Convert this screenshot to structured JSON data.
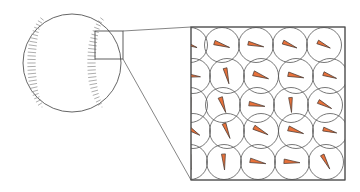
{
  "figure": {
    "background_color": "#ffffff",
    "width": 360,
    "height": 192
  },
  "colors": {
    "wedge_fill": "#E8713A",
    "wedge_stroke": "#4a3a32",
    "circle_stroke": "#555555",
    "panel_stroke": "#4d4d4d",
    "ball_stroke": "#555555",
    "seam_stroke": "#8a8a8a",
    "connector_stroke": "#666666",
    "inspect_box_stroke": "#4d4d4d"
  },
  "baseball": {
    "label": "baseball",
    "center_x": 72,
    "center_y": 63,
    "radius": 49,
    "stroke_width": 0.9,
    "seams": [
      {
        "name": "left-seam",
        "path": "M 42 19 C 28 36, 28 90, 42 107",
        "stitch_count": 26,
        "stitch_length": 7.5
      },
      {
        "name": "right-seam",
        "path": "M 102 19 C 88 36, 88 90, 102 107",
        "stitch_count": 26,
        "stitch_length": 7.5
      }
    ]
  },
  "inspection_box": {
    "label": "magnified-region",
    "x": 95,
    "y": 31,
    "width": 28,
    "height": 28,
    "stroke_width": 0.9
  },
  "connectors": [
    {
      "name": "connector-top",
      "x1": 123,
      "y1": 31,
      "x2": 191,
      "y2": 27
    },
    {
      "name": "connector-bottom",
      "x1": 123,
      "y1": 59,
      "x2": 191,
      "y2": 180
    }
  ],
  "magnified_panel": {
    "label": "magnified-view",
    "x": 191,
    "y": 27,
    "width": 154,
    "height": 153,
    "stroke_width": 0.9,
    "circle_radius": 17.5,
    "circle_stroke_width": 0.8,
    "wedge_stroke_width": 0.7,
    "wedge_length": 15.5,
    "wedge_half_angle": 8.5,
    "cells": [
      {
        "id": "c01",
        "cx": 190,
        "cy": 45,
        "angle": 200,
        "len": 15,
        "half_angle": 8
      },
      {
        "id": "c02",
        "cx": 222,
        "cy": 45,
        "angle": 198,
        "len": 16,
        "half_angle": 8
      },
      {
        "id": "c03",
        "cx": 256,
        "cy": 45,
        "angle": 193,
        "len": 16,
        "half_angle": 7
      },
      {
        "id": "c04",
        "cx": 290,
        "cy": 45,
        "angle": 203,
        "len": 15,
        "half_angle": 8
      },
      {
        "id": "c05",
        "cx": 324,
        "cy": 45,
        "angle": 206,
        "len": 14,
        "half_angle": 8
      },
      {
        "id": "c06",
        "cx": 193,
        "cy": 76,
        "angle": 186,
        "len": 15,
        "half_angle": 8
      },
      {
        "id": "c07",
        "cx": 227,
        "cy": 76,
        "angle": 256,
        "len": 16,
        "half_angle": 7
      },
      {
        "id": "c08",
        "cx": 261,
        "cy": 76,
        "angle": 200,
        "len": 16,
        "half_angle": 9
      },
      {
        "id": "c09",
        "cx": 296,
        "cy": 76,
        "angle": 193,
        "len": 16,
        "half_angle": 8
      },
      {
        "id": "c10",
        "cx": 330,
        "cy": 76,
        "angle": 200,
        "len": 14,
        "half_angle": 8
      },
      {
        "id": "c11",
        "cx": 190,
        "cy": 105,
        "angle": 264,
        "len": 15,
        "half_angle": 7
      },
      {
        "id": "c12",
        "cx": 223,
        "cy": 105,
        "angle": 250,
        "len": 16,
        "half_angle": 8
      },
      {
        "id": "c13",
        "cx": 257,
        "cy": 105,
        "angle": 190,
        "len": 16,
        "half_angle": 8
      },
      {
        "id": "c14",
        "cx": 291,
        "cy": 105,
        "angle": 266,
        "len": 15,
        "half_angle": 7
      },
      {
        "id": "c15",
        "cx": 325,
        "cy": 105,
        "angle": 208,
        "len": 15,
        "half_angle": 8
      },
      {
        "id": "c16",
        "cx": 193,
        "cy": 131,
        "angle": 212,
        "len": 16,
        "half_angle": 9
      },
      {
        "id": "c17",
        "cx": 227,
        "cy": 131,
        "angle": 248,
        "len": 16,
        "half_angle": 7
      },
      {
        "id": "c18",
        "cx": 261,
        "cy": 131,
        "angle": 208,
        "len": 16,
        "half_angle": 8
      },
      {
        "id": "c19",
        "cx": 296,
        "cy": 131,
        "angle": 199,
        "len": 16,
        "half_angle": 9
      },
      {
        "id": "c20",
        "cx": 330,
        "cy": 131,
        "angle": 196,
        "len": 14,
        "half_angle": 8
      },
      {
        "id": "c21",
        "cx": 190,
        "cy": 162,
        "angle": 262,
        "len": 15,
        "half_angle": 7
      },
      {
        "id": "c22",
        "cx": 224,
        "cy": 162,
        "angle": 266,
        "len": 16,
        "half_angle": 7
      },
      {
        "id": "c23",
        "cx": 258,
        "cy": 162,
        "angle": 192,
        "len": 16,
        "half_angle": 8
      },
      {
        "id": "c24",
        "cx": 292,
        "cy": 162,
        "angle": 185,
        "len": 16,
        "half_angle": 8
      },
      {
        "id": "c25",
        "cx": 326,
        "cy": 162,
        "angle": 242,
        "len": 16,
        "half_angle": 7
      }
    ]
  }
}
